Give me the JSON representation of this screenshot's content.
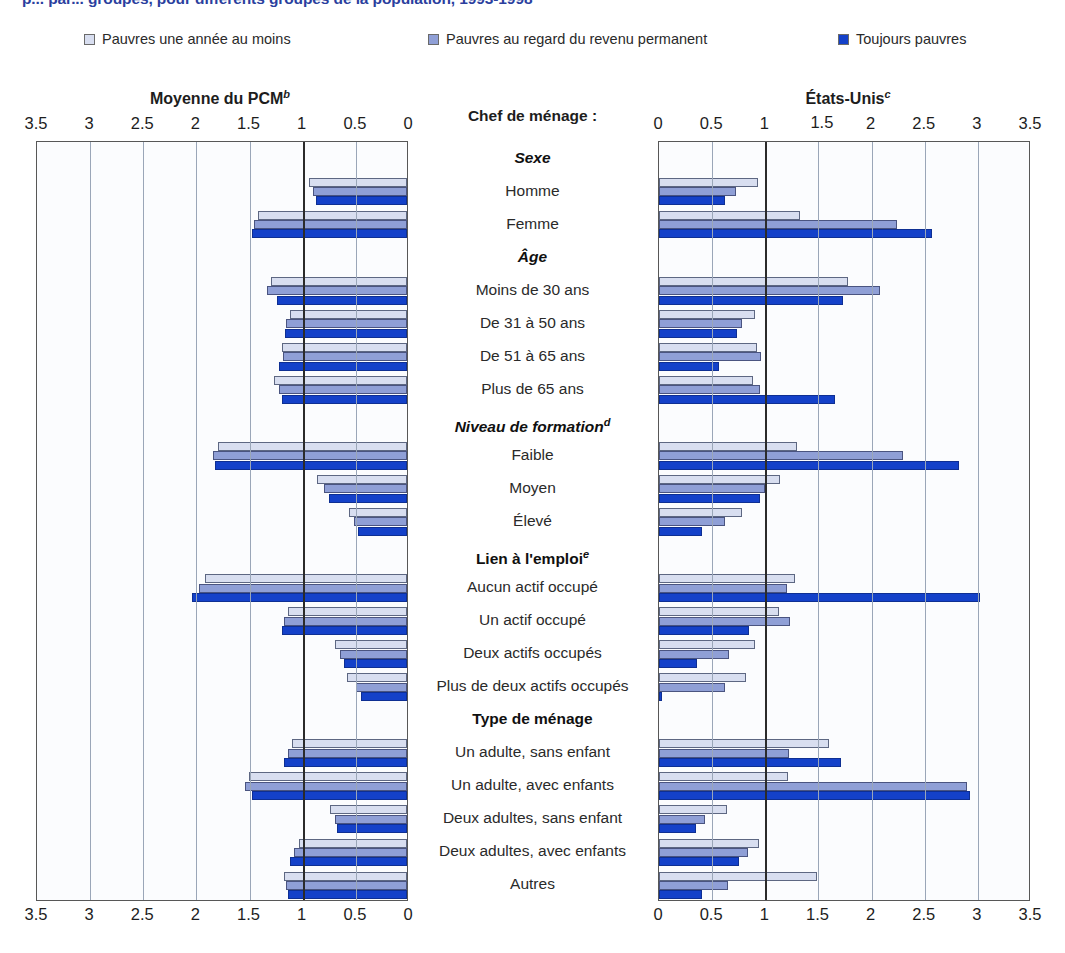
{
  "title": "p... par... groupes, pour différents groupes de la population, 1993-1998",
  "legend": [
    {
      "label": "Pauvres une année au moins",
      "color": "#d8def0"
    },
    {
      "label": "Pauvres au regard du revenu permanent",
      "color": "#8f9fd6"
    },
    {
      "label": "Toujours pauvres",
      "color": "#1441c9"
    }
  ],
  "center_header": "Chef de ménage :",
  "panels": {
    "left": {
      "title": "Moyenne du PCM",
      "superscript": "b"
    },
    "right": {
      "title": "États-Unis",
      "superscript": "c"
    }
  },
  "axis": {
    "left_ticks": [
      "3.5",
      "3",
      "2.5",
      "2",
      "1.5",
      "1",
      "0.5",
      "0"
    ],
    "right_ticks": [
      "0",
      "0.5",
      "1",
      "1.5",
      "2",
      "2.5",
      "3",
      "3.5"
    ],
    "right_ticks_top": [
      "0",
      "0.5",
      "1",
      "1.5",
      "2",
      "2.5",
      "3",
      "3.5"
    ],
    "min": 0,
    "max": 3.5,
    "reference_line": 1
  },
  "chart_data": {
    "type": "bar",
    "orientation": "horizontal-bidirectional",
    "xlabel": "",
    "ylabel": "",
    "xlim": [
      0,
      3.5
    ],
    "grid": true,
    "legend_position": "top",
    "panels": [
      "Moyenne du PCM",
      "États-Unis"
    ],
    "series_names": [
      "Pauvres une année au moins",
      "Pauvres au regard du revenu permanent",
      "Toujours pauvres"
    ],
    "series_colors": [
      "#d8def0",
      "#8f9fd6",
      "#1441c9"
    ],
    "rows": [
      {
        "label": "Sexe",
        "type": "group",
        "italic": true
      },
      {
        "label": "Homme",
        "type": "data",
        "left": [
          0.92,
          0.88,
          0.86
        ],
        "right": [
          0.93,
          0.72,
          0.62
        ]
      },
      {
        "label": "Femme",
        "type": "data",
        "left": [
          1.4,
          1.44,
          1.46
        ],
        "right": [
          1.33,
          2.24,
          2.57
        ]
      },
      {
        "label": "Âge",
        "type": "group",
        "italic": true
      },
      {
        "label": "Moins de 30 ans",
        "type": "data",
        "left": [
          1.28,
          1.32,
          1.22
        ],
        "right": [
          1.78,
          2.08,
          1.73
        ]
      },
      {
        "label": "De 31 à 50 ans",
        "type": "data",
        "left": [
          1.1,
          1.14,
          1.15
        ],
        "right": [
          0.9,
          0.78,
          0.73
        ]
      },
      {
        "label": "De 51 à 65 ans",
        "type": "data",
        "left": [
          1.18,
          1.17,
          1.2
        ],
        "right": [
          0.92,
          0.96,
          0.56
        ]
      },
      {
        "label": "Plus de 65 ans",
        "type": "data",
        "left": [
          1.25,
          1.2,
          1.18
        ],
        "right": [
          0.88,
          0.95,
          1.66
        ]
      },
      {
        "label": "Niveau de formation",
        "type": "group",
        "italic": true,
        "superscript": "d"
      },
      {
        "label": "Faible",
        "type": "data",
        "left": [
          1.78,
          1.83,
          1.81
        ],
        "right": [
          1.3,
          2.3,
          2.82
        ]
      },
      {
        "label": "Moyen",
        "type": "data",
        "left": [
          0.85,
          0.78,
          0.73
        ],
        "right": [
          1.14,
          1.0,
          0.95
        ]
      },
      {
        "label": "Élevé",
        "type": "data",
        "left": [
          0.55,
          0.5,
          0.46
        ],
        "right": [
          0.78,
          0.62,
          0.4
        ]
      },
      {
        "label": "Lien à l'emploi",
        "type": "group",
        "italic": false,
        "superscript": "e"
      },
      {
        "label": "Aucun actif occupé",
        "type": "data",
        "left": [
          1.9,
          1.96,
          2.02
        ],
        "right": [
          1.28,
          1.2,
          3.02
        ]
      },
      {
        "label": "Un actif occupé",
        "type": "data",
        "left": [
          1.12,
          1.16,
          1.18
        ],
        "right": [
          1.13,
          1.23,
          0.85
        ]
      },
      {
        "label": "Deux actifs occupés",
        "type": "data",
        "left": [
          0.68,
          0.63,
          0.59
        ],
        "right": [
          0.9,
          0.66,
          0.36
        ]
      },
      {
        "label": "Plus de deux actifs occupés",
        "type": "data",
        "left": [
          0.56,
          0.48,
          0.43
        ],
        "right": [
          0.82,
          0.62,
          0.03
        ]
      },
      {
        "label": "Type de ménage",
        "type": "group",
        "italic": false
      },
      {
        "label": "Un adulte, sans enfant",
        "type": "data",
        "left": [
          1.08,
          1.12,
          1.16
        ],
        "right": [
          1.6,
          1.22,
          1.71
        ]
      },
      {
        "label": "Un adulte, avec enfants",
        "type": "data",
        "left": [
          1.49,
          1.52,
          1.46
        ],
        "right": [
          1.21,
          2.9,
          2.93
        ]
      },
      {
        "label": "Deux adultes, sans enfant",
        "type": "data",
        "left": [
          0.72,
          0.68,
          0.66
        ],
        "right": [
          0.64,
          0.43,
          0.35
        ]
      },
      {
        "label": "Deux adultes, avec enfants",
        "type": "data",
        "left": [
          1.02,
          1.06,
          1.1
        ],
        "right": [
          0.94,
          0.84,
          0.75
        ]
      },
      {
        "label": "Autres",
        "type": "data",
        "left": [
          1.16,
          1.14,
          1.12
        ],
        "right": [
          1.49,
          0.65,
          0.4
        ]
      }
    ]
  }
}
